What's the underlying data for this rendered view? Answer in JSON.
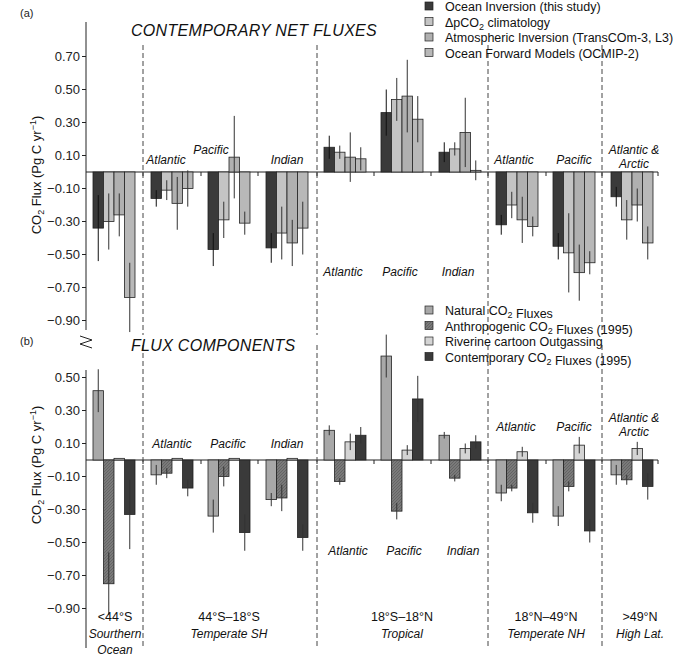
{
  "chart_data": [
    {
      "panel": "(a)",
      "type": "bar",
      "title": "CONTEMPORARY NET FLUXES",
      "ylabel": "CO2 Flux (Pg C yr-1)",
      "yticks": [
        "0.70",
        "0.50",
        "0.30",
        "0.10",
        "-0.10",
        "-0.30",
        "-0.50",
        "-0.70",
        "-0.90"
      ],
      "ylim": [
        -0.95,
        0.8
      ],
      "legend": [
        {
          "label": "Ocean Inversion (this study)",
          "color": "#3a3a3a"
        },
        {
          "label": "ΔpCO2 climatology",
          "color": "#c4c4c4"
        },
        {
          "label": "Atmospheric Inversion (TransCOm-3, L3)",
          "color": "#b0b0b0"
        },
        {
          "label": "Ocean Forward Models (OCMIP-2)",
          "color": "#b8b8b8"
        }
      ],
      "categories": [
        "<44°S",
        "Temperate SH Atlantic",
        "Temperate SH Pacific",
        "Temperate SH Indian",
        "Tropical Atlantic",
        "Tropical Pacific",
        "Tropical Indian",
        "Temperate NH Atlantic",
        "Temperate NH Pacific",
        "High Lat. Atlantic & Arctic"
      ],
      "series": [
        {
          "name": "Ocean Inversion (this study)",
          "values": [
            -0.34,
            -0.16,
            -0.47,
            -0.46,
            0.15,
            0.36,
            0.12,
            -0.32,
            -0.45,
            -0.15
          ],
          "errors": [
            0.2,
            0.05,
            0.1,
            0.09,
            0.07,
            0.14,
            0.06,
            0.06,
            0.08,
            0.06
          ]
        },
        {
          "name": "ΔpCO2 climatology",
          "values": [
            -0.3,
            -0.11,
            -0.29,
            -0.37,
            0.12,
            0.44,
            0.14,
            -0.2,
            -0.49,
            -0.29
          ],
          "errors": [
            0.17,
            0.06,
            0.11,
            0.16,
            0.04,
            0.13,
            0.04,
            0.08,
            0.24,
            0.12
          ]
        },
        {
          "name": "Atmospheric Inversion (TransCOm-3, L3)",
          "values": [
            -0.26,
            -0.19,
            0.09,
            -0.43,
            0.09,
            0.46,
            0.24,
            -0.29,
            -0.61,
            -0.2
          ],
          "errors": [
            0.13,
            0.16,
            0.25,
            0.14,
            0.15,
            0.22,
            0.21,
            0.14,
            0.17,
            0.1
          ]
        },
        {
          "name": "Ocean Forward Models (OCMIP-2)",
          "values": [
            -0.76,
            -0.1,
            -0.31,
            -0.34,
            0.08,
            0.32,
            0.01,
            -0.33,
            -0.55,
            -0.43
          ],
          "errors": [
            0.21,
            0.11,
            0.07,
            0.16,
            0.07,
            0.14,
            0.06,
            0.06,
            0.07,
            0.1
          ]
        }
      ],
      "region_labels": [
        {
          "text": "Atlantic",
          "x": 166,
          "y": 164
        },
        {
          "text": "Pacific",
          "x": 211,
          "y": 154
        },
        {
          "text": "Indian",
          "x": 287,
          "y": 164
        },
        {
          "text": "Atlantic",
          "x": 343,
          "y": 276
        },
        {
          "text": "Pacific",
          "x": 400,
          "y": 276
        },
        {
          "text": "Indian",
          "x": 458,
          "y": 276
        },
        {
          "text": "Atlantic",
          "x": 514,
          "y": 164
        },
        {
          "text": "Pacific",
          "x": 574,
          "y": 164
        },
        {
          "text": "Atlantic &",
          "x": 634,
          "y": 154
        },
        {
          "text": "Arctic",
          "x": 634,
          "y": 168
        }
      ]
    },
    {
      "panel": "(b)",
      "type": "bar",
      "title": "FLUX COMPONENTS",
      "ylabel": "CO2 Flux (Pg C yr-1)",
      "yticks": [
        "0.50",
        "0.30",
        "0.10",
        "-0.10",
        "-0.30",
        "-0.50",
        "-0.70",
        "-0.90"
      ],
      "ylim": [
        -0.95,
        0.6
      ],
      "legend": [
        {
          "label": "Natural CO2 Fluxes",
          "color": "#a8a8a8"
        },
        {
          "label": "Anthropogenic CO2 Fluxes (1995)",
          "color": "#7a7a7a"
        },
        {
          "label": "Riverine cartoon Outgassing",
          "color": "#d4d4d4"
        },
        {
          "label": "Contemporary CO2 Fluxes (1995)",
          "color": "#3a3a3a"
        }
      ],
      "categories": [
        "<44°S",
        "Temperate SH Atlantic",
        "Temperate SH Pacific",
        "Temperate SH Indian",
        "Tropical Atlantic",
        "Tropical Pacific",
        "Tropical Indian",
        "Temperate NH Atlantic",
        "Temperate NH Pacific",
        "High Lat. Atlantic & Arctic"
      ],
      "series": [
        {
          "name": "Natural CO2 Fluxes",
          "values": [
            0.42,
            -0.09,
            -0.34,
            -0.24,
            0.18,
            0.63,
            0.15,
            -0.2,
            -0.34,
            -0.09
          ],
          "errors": [
            0.13,
            0.06,
            0.1,
            0.04,
            0.03,
            0.13,
            0.02,
            0.05,
            0.06,
            0.06
          ]
        },
        {
          "name": "Anthropogenic CO2 Fluxes (1995)",
          "values": [
            -0.75,
            -0.08,
            -0.1,
            -0.23,
            -0.13,
            -0.31,
            -0.11,
            -0.17,
            -0.16,
            -0.12
          ],
          "errors": [
            0.19,
            0.03,
            0.06,
            0.08,
            0.02,
            0.05,
            0.02,
            0.02,
            0.03,
            0.03
          ]
        },
        {
          "name": "Riverine cartoon Outgassing",
          "values": [
            0.01,
            0.01,
            0.01,
            0.01,
            0.11,
            0.06,
            0.07,
            0.05,
            0.09,
            0.07
          ],
          "errors": [
            0.0,
            0.0,
            0.0,
            0.0,
            0.05,
            0.03,
            0.03,
            0.03,
            0.05,
            0.04
          ]
        },
        {
          "name": "Contemporary CO2 Fluxes (1995)",
          "values": [
            -0.33,
            -0.17,
            -0.44,
            -0.47,
            0.15,
            0.37,
            0.11,
            -0.32,
            -0.43,
            -0.16
          ],
          "errors": [
            0.21,
            0.05,
            0.11,
            0.08,
            0.05,
            0.14,
            0.04,
            0.06,
            0.07,
            0.08
          ]
        }
      ],
      "region_labels": [
        {
          "text": "Atlantic",
          "x": 172,
          "y": 448
        },
        {
          "text": "Pacific",
          "x": 228,
          "y": 448
        },
        {
          "text": "Indian",
          "x": 287,
          "y": 448
        },
        {
          "text": "Atlantic",
          "x": 348,
          "y": 555
        },
        {
          "text": "Pacific",
          "x": 404,
          "y": 555
        },
        {
          "text": "Indian",
          "x": 463,
          "y": 555
        },
        {
          "text": "Atlantic",
          "x": 516,
          "y": 431
        },
        {
          "text": "Pacific",
          "x": 574,
          "y": 431
        },
        {
          "text": "Atlantic &",
          "x": 634,
          "y": 422
        },
        {
          "text": "Arctic",
          "x": 634,
          "y": 436
        }
      ]
    }
  ],
  "x_axis_groups": [
    {
      "line1": "<44°S",
      "line2": "Sourthern",
      "line3": "Ocean",
      "x": 115
    },
    {
      "line1": "44°S–18°S",
      "line2": "Temperate SH",
      "line3": "",
      "x": 229
    },
    {
      "line1": "18°S–18°N",
      "line2": "Tropical",
      "line3": "",
      "x": 402
    },
    {
      "line1": "18°N–49°N",
      "line2": "Temperate NH",
      "line3": "",
      "x": 546
    },
    {
      "line1": ">49°N",
      "line2": "High Lat.",
      "line3": "",
      "x": 640
    }
  ]
}
